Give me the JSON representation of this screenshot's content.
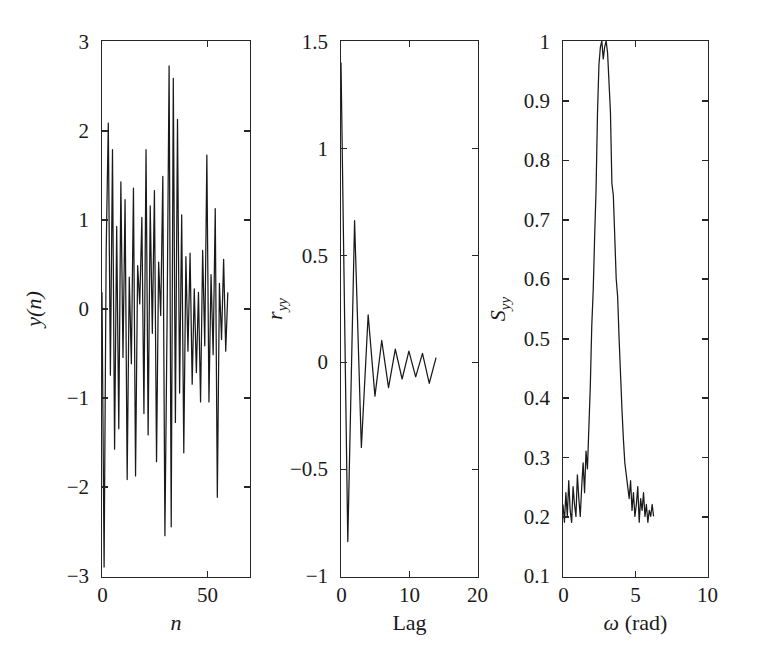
{
  "figure": {
    "background": "#ffffff",
    "line_color": "#1a1a1a",
    "axis_color": "#262626",
    "panel_count": 3
  },
  "panels": [
    {
      "id": "time-series",
      "ylabel_main": "y",
      "ylabel_arg": "(n)",
      "xlabel": "n",
      "yticks": [
        "3",
        "2",
        "1",
        "0",
        "-1",
        "-2",
        "-3"
      ],
      "xticks": [
        "0",
        "50"
      ]
    },
    {
      "id": "autocorrelation",
      "ylabel_main": "r",
      "ylabel_sub": "yy",
      "xlabel": "Lag",
      "yticks": [
        "1.5",
        "1",
        "0.5",
        "0",
        "-0.5",
        "-1"
      ],
      "xticks": [
        "0",
        "10",
        "20"
      ]
    },
    {
      "id": "power-spectrum",
      "ylabel_main": "S",
      "ylabel_sub": "yy",
      "xlabel_main": "ω",
      "xlabel_unit": " (rad)",
      "yticks": [
        "1",
        "0.9",
        "0.8",
        "0.7",
        "0.6",
        "0.5",
        "0.4",
        "0.3",
        "0.2",
        "0.1"
      ],
      "xticks": [
        "0",
        "5",
        "10"
      ]
    }
  ],
  "chart_data": [
    {
      "type": "line",
      "id": "time-series",
      "title": "",
      "xlabel": "n",
      "ylabel": "y(n)",
      "xlim": [
        0,
        70
      ],
      "ylim": [
        -3,
        3
      ],
      "xtick_values": [
        0,
        50
      ],
      "ytick_values": [
        -3,
        -2,
        -1,
        0,
        1,
        2,
        3
      ],
      "grid": false,
      "legend": "none",
      "notes": "Zero-mean narrowband random signal, ~61 samples, peak excursions +2.7 / -2.9",
      "x": [
        0,
        1,
        2,
        3,
        4,
        5,
        6,
        7,
        8,
        9,
        10,
        11,
        12,
        13,
        14,
        15,
        16,
        17,
        18,
        19,
        20,
        21,
        22,
        23,
        24,
        25,
        26,
        27,
        28,
        29,
        30,
        31,
        32,
        33,
        34,
        35,
        36,
        37,
        38,
        39,
        40,
        41,
        42,
        43,
        44,
        45,
        46,
        47,
        48,
        49,
        50,
        51,
        52,
        53,
        54,
        55,
        56,
        57,
        58,
        59,
        60
      ],
      "values": [
        0.18,
        -2.9,
        0.65,
        2.08,
        -0.75,
        1.78,
        -1.58,
        0.92,
        -1.35,
        1.42,
        -0.55,
        1.22,
        -1.92,
        0.35,
        -0.62,
        1.35,
        -1.88,
        0.48,
        0.05,
        1.02,
        -1.18,
        1.78,
        -1.42,
        1.15,
        -0.28,
        1.32,
        -1.72,
        0.52,
        -0.08,
        1.48,
        -2.55,
        -0.22,
        2.72,
        -2.45,
        2.58,
        -1.28,
        2.12,
        -0.95,
        1.05,
        -1.62,
        0.58,
        -0.48,
        0.62,
        -0.85,
        0.22,
        -0.72,
        0.18,
        -1.05,
        0.65,
        -0.42,
        1.72,
        -1.05,
        0.38,
        -0.52,
        1.12,
        -2.12,
        0.28,
        -0.35,
        0.55,
        -0.48,
        0.18
      ]
    },
    {
      "type": "line",
      "id": "autocorrelation",
      "title": "",
      "xlabel": "Lag",
      "ylabel": "r_yy",
      "xlim": [
        0,
        20
      ],
      "ylim": [
        -1,
        1.5
      ],
      "xtick_values": [
        0,
        10,
        20
      ],
      "ytick_values": [
        -1,
        -0.5,
        0,
        0.5,
        1,
        1.5
      ],
      "grid": false,
      "legend": "none",
      "notes": "Oscillating, exponentially decaying autocorrelation; r(0)=1.40, alternating sign, decays to near zero by lag 8",
      "x": [
        0,
        1,
        2,
        3,
        4,
        5,
        6,
        7,
        8,
        9,
        10,
        11,
        12,
        13,
        14
      ],
      "values": [
        1.4,
        -0.84,
        0.66,
        -0.4,
        0.22,
        -0.16,
        0.1,
        -0.12,
        0.06,
        -0.08,
        0.05,
        -0.07,
        0.04,
        -0.1,
        0.02
      ]
    },
    {
      "type": "line",
      "id": "power-spectrum",
      "title": "",
      "xlabel": "ω (rad)",
      "ylabel": "S_yy",
      "xlim": [
        0,
        10
      ],
      "ylim": [
        0.1,
        1.0
      ],
      "xtick_values": [
        0,
        5,
        10
      ],
      "ytick_values": [
        0.1,
        0.2,
        0.3,
        0.4,
        0.5,
        0.6,
        0.7,
        0.8,
        0.9,
        1.0
      ],
      "grid": false,
      "legend": "none",
      "notes": "Narrowband power spectrum with sharp peak at omega = 3.0 rad reaching 1.0; noise floor approx 0.20-0.25; data ends near omega = 6.3 rad",
      "x": [
        0.0,
        0.1,
        0.2,
        0.3,
        0.4,
        0.5,
        0.6,
        0.7,
        0.8,
        0.9,
        1.0,
        1.1,
        1.2,
        1.3,
        1.4,
        1.5,
        1.6,
        1.7,
        1.8,
        1.9,
        2.0,
        2.1,
        2.2,
        2.3,
        2.4,
        2.5,
        2.6,
        2.7,
        2.8,
        2.9,
        3.0,
        3.1,
        3.2,
        3.3,
        3.4,
        3.5,
        3.6,
        3.7,
        3.8,
        3.9,
        4.0,
        4.1,
        4.2,
        4.3,
        4.4,
        4.5,
        4.6,
        4.7,
        4.8,
        4.9,
        5.0,
        5.1,
        5.2,
        5.3,
        5.4,
        5.5,
        5.6,
        5.7,
        5.8,
        5.9,
        6.0,
        6.1,
        6.2,
        6.3
      ],
      "values": [
        0.22,
        0.19,
        0.24,
        0.2,
        0.26,
        0.21,
        0.19,
        0.25,
        0.22,
        0.2,
        0.27,
        0.23,
        0.2,
        0.25,
        0.29,
        0.24,
        0.31,
        0.28,
        0.35,
        0.42,
        0.52,
        0.58,
        0.67,
        0.75,
        0.88,
        0.96,
        0.99,
        1.0,
        0.97,
        0.99,
        1.0,
        0.98,
        0.93,
        0.88,
        0.76,
        0.74,
        0.67,
        0.6,
        0.57,
        0.5,
        0.44,
        0.38,
        0.33,
        0.29,
        0.27,
        0.25,
        0.23,
        0.26,
        0.21,
        0.24,
        0.2,
        0.22,
        0.25,
        0.19,
        0.23,
        0.21,
        0.24,
        0.2,
        0.22,
        0.19,
        0.21,
        0.2,
        0.22,
        0.2
      ]
    }
  ]
}
